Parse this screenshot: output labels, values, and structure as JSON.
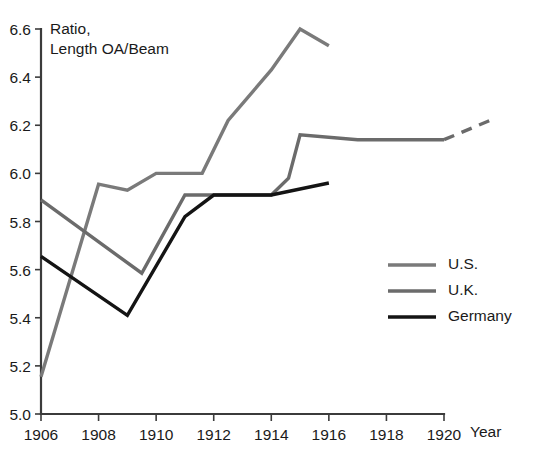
{
  "chart_data": {
    "type": "line",
    "title": "",
    "ylabel": "Ratio,\nLength OA/Beam",
    "ylabel_line1": "Ratio,",
    "ylabel_line2": "Length OA/Beam",
    "xlabel": "Year",
    "xlim": [
      1906,
      1920
    ],
    "ylim": [
      5.0,
      6.6
    ],
    "xticks": [
      1906,
      1908,
      1910,
      1912,
      1914,
      1916,
      1918,
      1920
    ],
    "xticklabels": [
      "1906",
      "1908",
      "1910",
      "1912",
      "1914",
      "1916",
      "1918",
      "1920"
    ],
    "yticks": [
      5.0,
      5.2,
      5.4,
      5.6,
      5.8,
      6.0,
      6.2,
      6.4,
      6.6
    ],
    "yticklabels": [
      "5.0",
      "5.2",
      "5.4",
      "5.6",
      "5.8",
      "6.0",
      "6.2",
      "6.4",
      "6.6"
    ],
    "grid": false,
    "legend_position": "center-right",
    "series": [
      {
        "name": "U.S.",
        "color": "#7a7a7a",
        "linewidth": 3.4,
        "style": "solid",
        "x": [
          1906,
          1908,
          1909,
          1910,
          1911,
          1911.6,
          1912.5,
          1914,
          1915,
          1916
        ],
        "values": [
          5.155,
          5.955,
          5.93,
          6.0,
          6.0,
          6.0,
          6.22,
          6.43,
          6.6,
          6.53
        ]
      },
      {
        "name": "U.K.",
        "color": "#6b6b6b",
        "linewidth": 3.4,
        "style": "solid",
        "x": [
          1906,
          1909.5,
          1911,
          1912,
          1914,
          1914.6,
          1915,
          1917,
          1920
        ],
        "values": [
          5.89,
          5.585,
          5.91,
          5.91,
          5.91,
          5.98,
          6.16,
          6.14,
          6.14
        ]
      },
      {
        "name": "U.K. (projected)",
        "color": "#6b6b6b",
        "linewidth": 3.4,
        "style": "dashed",
        "x": [
          1920,
          1921.6
        ],
        "values": [
          6.14,
          6.22
        ]
      },
      {
        "name": "Germany",
        "color": "#141414",
        "linewidth": 3.4,
        "style": "solid",
        "x": [
          1906,
          1909,
          1911,
          1912,
          1914,
          1916
        ],
        "values": [
          5.655,
          5.41,
          5.82,
          5.91,
          5.91,
          5.96
        ]
      }
    ],
    "legend": [
      {
        "label": "U.S.",
        "color": "#7a7a7a"
      },
      {
        "label": "U.K.",
        "color": "#6b6b6b"
      },
      {
        "label": "Germany",
        "color": "#141414"
      }
    ]
  }
}
